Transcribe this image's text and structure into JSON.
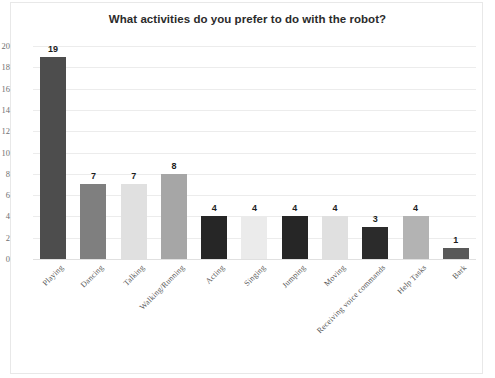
{
  "chart_data": {
    "type": "bar",
    "title": "What activities do you prefer to do with the robot?",
    "xlabel": "",
    "ylabel": "",
    "ylim": [
      0,
      20
    ],
    "ytick_step": 2,
    "grid": true,
    "legend": "none",
    "categories": [
      "Playing",
      "Dancing",
      "Talking",
      "Walking/Running",
      "Acting",
      "Singing",
      "Jumping",
      "Moving",
      "Receiving voice commands",
      "Help Tasks",
      "Bark"
    ],
    "values": [
      19,
      7,
      7,
      8,
      4,
      4,
      4,
      4,
      3,
      4,
      1
    ],
    "bar_colors": [
      "#4d4d4d",
      "#7f7f7f",
      "#e0e0e0",
      "#a6a6a6",
      "#262626",
      "#ebebeb",
      "#262626",
      "#e0e0e0",
      "#2b2b2b",
      "#b3b3b3",
      "#595959"
    ],
    "ytick_labels": [
      "0",
      "2",
      "4",
      "6",
      "8",
      "10",
      "12",
      "14",
      "16",
      "18",
      "20"
    ],
    "data_labels": [
      "19",
      "7",
      "7",
      "8",
      "4",
      "4",
      "4",
      "4",
      "3",
      "4",
      "1"
    ]
  },
  "colors": {
    "title_text": "#2b2b2b",
    "axis_text": "#6f6f6f",
    "gridline": "#ececec",
    "frame": "#e8e8e8",
    "value_label": "#1d1d1d"
  },
  "caption": ""
}
